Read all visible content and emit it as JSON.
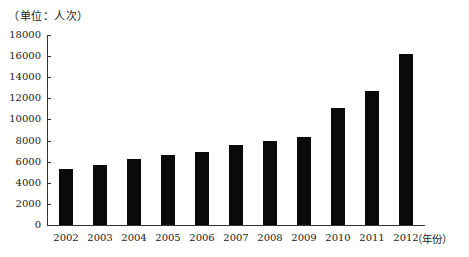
{
  "chart_data": {
    "type": "bar",
    "title": "",
    "unit_label": "（单位：人次）",
    "xlabel": "（年份）",
    "ylabel": "",
    "categories": [
      "2002",
      "2003",
      "2004",
      "2005",
      "2006",
      "2007",
      "2008",
      "2009",
      "2010",
      "2011",
      "2012"
    ],
    "values": [
      5300,
      5700,
      6250,
      6650,
      6900,
      7600,
      7950,
      8350,
      11100,
      12700,
      16200
    ],
    "ylim": [
      0,
      18000
    ],
    "yticks": [
      0,
      2000,
      4000,
      6000,
      8000,
      10000,
      12000,
      14000,
      16000,
      18000
    ],
    "grid": false,
    "legend": null,
    "bar_color": "#0a0a0a"
  }
}
